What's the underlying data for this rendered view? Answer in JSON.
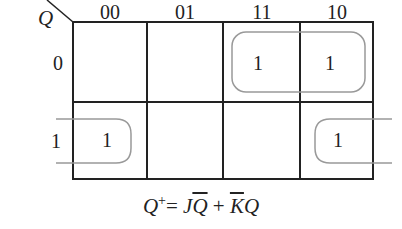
{
  "kmap": {
    "row_variable": "Q",
    "column_headers": [
      "00",
      "01",
      "11",
      "10"
    ],
    "row_headers": [
      "0",
      "1"
    ],
    "cells": [
      [
        "",
        "",
        "1",
        "1"
      ],
      [
        "1",
        "",
        "",
        "1"
      ]
    ],
    "groupings": [
      {
        "name": "JQbar",
        "cells": [
          [
            0,
            2
          ],
          [
            0,
            3
          ]
        ]
      },
      {
        "name": "KbarQ",
        "cells": [
          [
            1,
            0
          ],
          [
            1,
            3
          ]
        ],
        "wraps": true
      }
    ],
    "colors": {
      "grid": "#222222",
      "loop": "#999999"
    }
  },
  "equation": {
    "lhs": "Q",
    "lhs_sup": "+",
    "eq": "= ",
    "t1_a": "J",
    "t1_b": "Q",
    "plus": " + ",
    "t2_a": "K",
    "t2_b": "Q"
  }
}
